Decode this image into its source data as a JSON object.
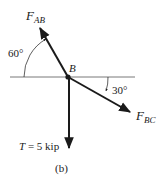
{
  "diagram": {
    "type": "free-body diagram",
    "caption": "(b)",
    "point": {
      "label": "B"
    },
    "forces": [
      {
        "id": "FAB",
        "symbol": "F",
        "subscript": "AB",
        "angle_label": "60°",
        "direction": "up-left, 60° above horizontal"
      },
      {
        "id": "FBC",
        "symbol": "F",
        "subscript": "BC",
        "angle_label": "30°",
        "direction": "down-right, 30° below horizontal"
      },
      {
        "id": "T",
        "symbol": "T",
        "value_text": " = 5 kip",
        "direction": "straight down"
      }
    ],
    "colors": {
      "line": "#1a1a1a",
      "thin_line": "#555555",
      "background": "#ffffff"
    }
  }
}
